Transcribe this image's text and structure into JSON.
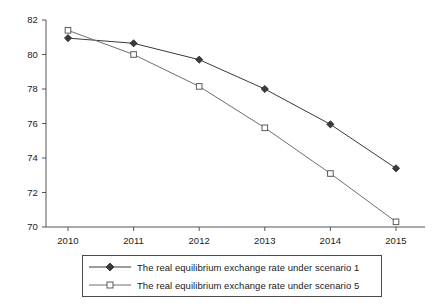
{
  "chart_data": {
    "type": "line",
    "title": "",
    "xlabel": "",
    "ylabel": "",
    "categories": [
      "2010",
      "2011",
      "2012",
      "2013",
      "2014",
      "2015"
    ],
    "x": [
      2010,
      2011,
      2012,
      2013,
      2014,
      2015
    ],
    "xlim": [
      2010,
      2015
    ],
    "ylim": [
      70,
      82
    ],
    "yticks": [
      70,
      72,
      74,
      76,
      78,
      80,
      82
    ],
    "ytick_labels": [
      "70",
      "72",
      "74",
      "76",
      "78",
      "80",
      "82"
    ],
    "xtick_labels": [
      "2010",
      "2011",
      "2012",
      "2013",
      "2014",
      "2015"
    ],
    "grid": false,
    "legend_position": "bottom",
    "series": [
      {
        "name": "The real equilibrium exchange rate under scenario 1",
        "marker": "diamond-filled",
        "color": "#3a3a3a",
        "values": [
          80.95,
          80.65,
          79.7,
          78.0,
          75.95,
          73.4
        ]
      },
      {
        "name": "The real equilibrium exchange rate under scenario 5",
        "marker": "square-open",
        "color": "#6e6e6e",
        "values": [
          81.4,
          80.0,
          78.15,
          75.75,
          73.1,
          70.3
        ]
      }
    ]
  },
  "legend": {
    "items": [
      {
        "label": "The real equilibrium exchange rate under scenario 1"
      },
      {
        "label": "The real equilibrium exchange rate under scenario 5"
      }
    ]
  },
  "axes": {
    "y_labels": [
      "82",
      "80",
      "78",
      "76",
      "74",
      "72",
      "70"
    ],
    "x_labels": [
      "2010",
      "2011",
      "2012",
      "2013",
      "2014",
      "2015"
    ]
  },
  "colors": {
    "series1": "#3a3a3a",
    "series5": "#6e6e6e",
    "axis": "#555555",
    "text": "#1a1a1a",
    "background": "#ffffff"
  }
}
